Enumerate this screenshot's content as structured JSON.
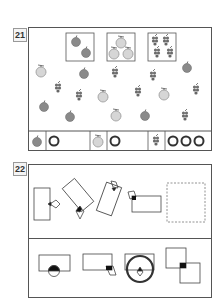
{
  "q21": {
    "number": "21",
    "groups": [
      "apples-2",
      "melons-3",
      "grapes-4"
    ],
    "answer_row": [
      {
        "fruit": "apple",
        "marks": "O"
      },
      {
        "fruit": "melon",
        "marks": "O"
      },
      {
        "fruit": "grape",
        "marks": "OOO"
      }
    ]
  },
  "q22": {
    "number": "22"
  },
  "colors": {
    "apple": "#8a8a8a",
    "melon": "#cfcfcf",
    "grape": "#6e6e6e",
    "line": "#555555"
  }
}
